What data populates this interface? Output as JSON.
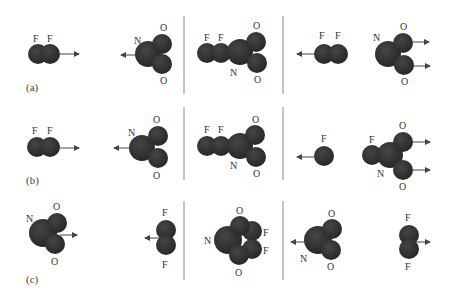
{
  "figure": {
    "rows": [
      {
        "label": "(a)",
        "groups": [
          {
            "id": "a-left",
            "molecules": [
              {
                "name": "F2",
                "atoms": [
                  "F",
                  "F"
                ],
                "arrow": "right"
              },
              {
                "name": "NO2",
                "atoms": [
                  "N",
                  "O",
                  "O"
                ],
                "arrow": "left"
              }
            ]
          },
          {
            "id": "a-middle",
            "molecules": [
              {
                "name": "F2NO2-complex",
                "atoms": [
                  "F",
                  "F",
                  "N",
                  "O",
                  "O"
                ],
                "arrow": "none"
              }
            ]
          },
          {
            "id": "a-right",
            "molecules": [
              {
                "name": "F2",
                "atoms": [
                  "F",
                  "F"
                ],
                "arrow": "left"
              },
              {
                "name": "NO2",
                "atoms": [
                  "N",
                  "O",
                  "O"
                ],
                "arrow": "right"
              }
            ]
          }
        ]
      },
      {
        "label": "(b)",
        "groups": [
          {
            "id": "b-left",
            "molecules": [
              {
                "name": "F2",
                "atoms": [
                  "F",
                  "F"
                ],
                "arrow": "right"
              },
              {
                "name": "NO2",
                "atoms": [
                  "N",
                  "O",
                  "O"
                ],
                "arrow": "left"
              }
            ]
          },
          {
            "id": "b-middle",
            "molecules": [
              {
                "name": "F2NO2-complex",
                "atoms": [
                  "F",
                  "F",
                  "N",
                  "O",
                  "O"
                ],
                "arrow": "none"
              }
            ]
          },
          {
            "id": "b-right",
            "molecules": [
              {
                "name": "F",
                "atoms": [
                  "F"
                ],
                "arrow": "left"
              },
              {
                "name": "FNO2",
                "atoms": [
                  "F",
                  "N",
                  "O",
                  "O"
                ],
                "arrow": "right"
              }
            ]
          }
        ]
      },
      {
        "label": "(c)",
        "groups": [
          {
            "id": "c-left",
            "molecules": [
              {
                "name": "NO2",
                "atoms": [
                  "N",
                  "O",
                  "O"
                ],
                "arrow": "right"
              },
              {
                "name": "F2",
                "atoms": [
                  "F",
                  "F"
                ],
                "arrow": "left"
              }
            ]
          },
          {
            "id": "c-middle",
            "molecules": [
              {
                "name": "NO2F2-complex",
                "atoms": [
                  "N",
                  "O",
                  "O",
                  "F",
                  "F"
                ],
                "arrow": "none"
              }
            ]
          },
          {
            "id": "c-right",
            "molecules": [
              {
                "name": "NO2",
                "atoms": [
                  "N",
                  "O",
                  "O"
                ],
                "arrow": "left"
              },
              {
                "name": "F2",
                "atoms": [
                  "F",
                  "F"
                ],
                "arrow": "right"
              }
            ]
          }
        ]
      }
    ],
    "labels": {
      "F": "F",
      "N": "N",
      "O": "O",
      "row_a": "(a)",
      "row_b": "(b)",
      "row_c": "(c)"
    },
    "colors": {
      "atom_fill": "#2e2e2e",
      "atom_edge": "#1a1a1a",
      "divider": "#888888",
      "arrow": "#444444",
      "text": "#333333",
      "background": "#ffffff"
    }
  }
}
